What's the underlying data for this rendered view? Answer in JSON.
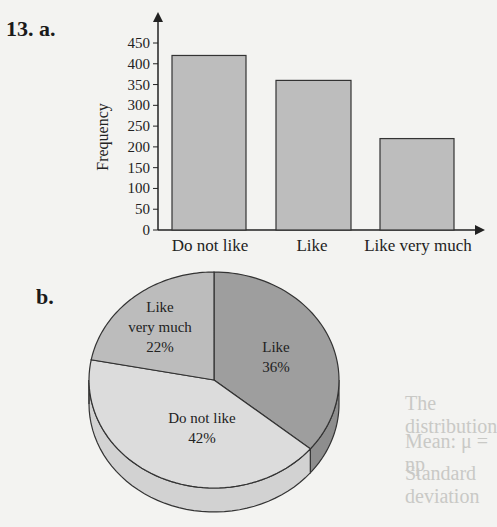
{
  "question": {
    "number_label": "13. a.",
    "part_b_label": "b."
  },
  "bleed_through_text": [
    "The distribution",
    "Mean: μ = np",
    "Standard deviation"
  ],
  "chart_data": [
    {
      "type": "bar",
      "title": "",
      "xlabel": "",
      "ylabel": "Frequency",
      "categories": [
        "Do not like",
        "Like",
        "Like very much"
      ],
      "values": [
        420,
        360,
        220
      ],
      "ylim": [
        0,
        450
      ],
      "yticks": [
        "0",
        "50",
        "100",
        "150",
        "200",
        "250",
        "300",
        "350",
        "400",
        "450"
      ],
      "grid": false,
      "bar_color": "#bdbdbd",
      "axis_arrows": true
    },
    {
      "type": "pie",
      "style": "3d",
      "title": "",
      "slices": [
        {
          "label": "Like",
          "label_line1": "Like",
          "label_line2": "",
          "percent_text": "36%",
          "value": 36,
          "color": "#9e9e9e"
        },
        {
          "label": "Do not like",
          "label_line1": "Do not like",
          "label_line2": "",
          "percent_text": "42%",
          "value": 42,
          "color": "#dcdcdc"
        },
        {
          "label": "Like very much",
          "label_line1": "Like",
          "label_line2": "very much",
          "percent_text": "22%",
          "value": 22,
          "color": "#bcbcbc"
        }
      ]
    }
  ]
}
